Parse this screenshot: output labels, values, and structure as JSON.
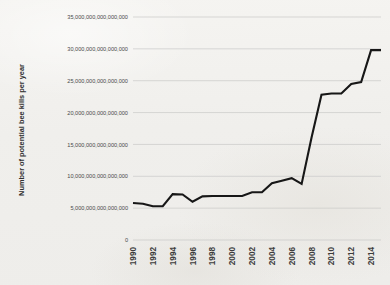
{
  "chart_data": {
    "type": "line",
    "title": "",
    "xlabel": "",
    "ylabel": "Number of potential bee kills per year",
    "x": [
      1990,
      1991,
      1992,
      1993,
      1994,
      1995,
      1996,
      1997,
      1998,
      1999,
      2000,
      2001,
      2002,
      2003,
      2004,
      2005,
      2006,
      2007,
      2008,
      2009,
      2010,
      2011,
      2012,
      2013,
      2014,
      2015
    ],
    "values": [
      5800000000000000,
      5700000000000000,
      5300000000000000,
      5300000000000000,
      7200000000000000,
      7150000000000000,
      6000000000000000,
      6850000000000000,
      6900000000000000,
      6900000000000000,
      6900000000000000,
      6900000000000000,
      7500000000000000,
      7500000000000000,
      8900000000000000,
      9300000000000000,
      9700000000000000,
      8800000000000000,
      16100000000000000,
      22800000000000000,
      23000000000000000,
      23000000000000000,
      24500000000000000,
      24800000000000000,
      29800000000000000,
      29800000000000000
    ],
    "series": [
      {
        "name": "Potential bee kills",
        "values": [
          5800000000000000,
          5700000000000000,
          5300000000000000,
          5300000000000000,
          7200000000000000,
          7150000000000000,
          6000000000000000,
          6850000000000000,
          6900000000000000,
          6900000000000000,
          6900000000000000,
          6900000000000000,
          7500000000000000,
          7500000000000000,
          8900000000000000,
          9300000000000000,
          9700000000000000,
          8800000000000000,
          16100000000000000,
          22800000000000000,
          23000000000000000,
          23000000000000000,
          24500000000000000,
          24800000000000000,
          29800000000000000,
          29800000000000000
        ],
        "color": "#171717"
      }
    ],
    "ylim": [
      0,
      35000000000000000
    ],
    "xlim": [
      1990,
      2015
    ],
    "ytick_values": [
      0,
      5000000000000000,
      10000000000000000,
      15000000000000000,
      20000000000000000,
      25000000000000000,
      30000000000000000,
      35000000000000000
    ],
    "ytick_labels": [
      "0",
      "5,000,000,000,000,000",
      "10,000,000,000,000,000",
      "15,000,000,000,000,000",
      "20,000,000,000,000,000",
      "25,000,000,000,000,000",
      "30,000,000,000,000,000",
      "35,000,000,000,000,000"
    ],
    "xtick_values": [
      1990,
      1992,
      1994,
      1996,
      1998,
      2000,
      2002,
      2004,
      2006,
      2008,
      2010,
      2012,
      2014
    ],
    "xtick_labels": [
      "1990",
      "1992",
      "1994",
      "1996",
      "1998",
      "2000",
      "2002",
      "2004",
      "2006",
      "2008",
      "2010",
      "2012",
      "2014"
    ],
    "xtick_rotation": -90,
    "grid": {
      "horizontal": true,
      "vertical": false,
      "color": "#c9c9c7"
    },
    "legend": {
      "visible": false,
      "position": "none"
    },
    "plot_border": false,
    "background_color": "#f2f1ee",
    "line_color": "#171717"
  }
}
